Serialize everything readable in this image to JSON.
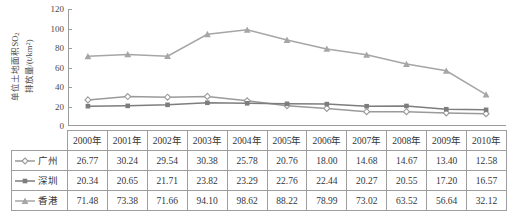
{
  "chart_data": {
    "type": "line",
    "title": "",
    "xlabel": "",
    "ylabel": "单位土地面积SO₂排放量/(t/km²)",
    "ylabel_line1": "单位土地面积SO",
    "ylabel_line1_sub": "2",
    "ylabel_line2_a": "排放量/(t/km",
    "ylabel_line2_sup": "2",
    "ylabel_line2_b": ")",
    "categories": [
      "2000年",
      "2001年",
      "2002年",
      "2003年",
      "2004年",
      "2005年",
      "2006年",
      "2007年",
      "2008年",
      "2009年",
      "2010年"
    ],
    "ylim": [
      0,
      120
    ],
    "yticks": [
      0,
      20,
      40,
      60,
      80,
      100,
      120
    ],
    "ytick_labels": [
      "0",
      "20",
      "40",
      "60",
      "80",
      "100",
      "120"
    ],
    "grid": false,
    "legend_position": "table-row-labels",
    "series": [
      {
        "name": "广州",
        "marker": "diamond",
        "color": "#9a9a9a",
        "values": [
          26.77,
          30.24,
          29.54,
          30.38,
          25.78,
          20.76,
          18.0,
          14.68,
          14.67,
          13.4,
          12.58
        ]
      },
      {
        "name": "深圳",
        "marker": "square",
        "color": "#7d7d7d",
        "values": [
          20.34,
          20.65,
          21.71,
          23.82,
          23.29,
          22.76,
          22.44,
          20.27,
          20.55,
          17.2,
          16.57
        ]
      },
      {
        "name": "香港",
        "marker": "triangle",
        "color": "#a6a6a6",
        "values": [
          71.48,
          73.38,
          71.66,
          94.1,
          98.62,
          88.22,
          78.99,
          73.02,
          63.52,
          56.64,
          32.12
        ]
      }
    ]
  },
  "table": {
    "corner_label": "",
    "columns": [
      "2000年",
      "2001年",
      "2002年",
      "2003年",
      "2004年",
      "2005年",
      "2006年",
      "2007年",
      "2008年",
      "2009年",
      "2010年"
    ],
    "rows": [
      {
        "label": "广州",
        "marker": "diamond",
        "values": [
          "26.77",
          "30.24",
          "29.54",
          "30.38",
          "25.78",
          "20.76",
          "18.00",
          "14.68",
          "14.67",
          "13.40",
          "12.58"
        ]
      },
      {
        "label": "深圳",
        "marker": "square",
        "values": [
          "20.34",
          "20.65",
          "21.71",
          "23.82",
          "23.29",
          "22.76",
          "22.44",
          "20.27",
          "20.55",
          "17.20",
          "16.57"
        ]
      },
      {
        "label": "香港",
        "marker": "triangle",
        "values": [
          "71.48",
          "73.38",
          "71.66",
          "94.10",
          "98.62",
          "88.22",
          "78.99",
          "73.02",
          "63.52",
          "56.64",
          "32.12"
        ]
      }
    ]
  },
  "colors": {
    "axis": "#9c9c9c",
    "grid_border": "#9e9e9e",
    "text": "#353535",
    "series_guangzhou": "#9a9a9a",
    "series_shenzhen": "#7d7d7d",
    "series_hongkong": "#a6a6a6"
  }
}
